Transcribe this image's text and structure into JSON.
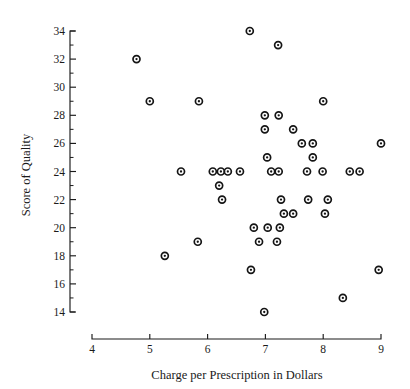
{
  "chart_data": {
    "type": "scatter",
    "title": "",
    "xlabel": "Charge per Prescription in Dollars",
    "ylabel": "Score of Quality",
    "xlim": [
      4,
      9
    ],
    "ylim": [
      14,
      34
    ],
    "x_ticks": [
      4,
      5,
      6,
      7,
      8,
      9
    ],
    "x_tick_labels": [
      "4",
      "5",
      "6",
      "7",
      "8",
      "9"
    ],
    "y_ticks": [
      14,
      16,
      18,
      20,
      22,
      24,
      26,
      28,
      30,
      32,
      34
    ],
    "y_tick_labels": [
      "14",
      "16",
      "18",
      "20",
      "22",
      "24",
      "26",
      "28",
      "30",
      "32",
      "34"
    ],
    "y_minor_tick_step": 1,
    "grid": false,
    "legend": null,
    "marker": "circle-with-center-dot",
    "marker_color": "#151515",
    "points": [
      {
        "x": 6.73,
        "y": 34
      },
      {
        "x": 7.22,
        "y": 33
      },
      {
        "x": 4.77,
        "y": 32
      },
      {
        "x": 5.0,
        "y": 29
      },
      {
        "x": 5.85,
        "y": 29
      },
      {
        "x": 8.0,
        "y": 29
      },
      {
        "x": 6.99,
        "y": 28
      },
      {
        "x": 7.23,
        "y": 28
      },
      {
        "x": 6.99,
        "y": 27
      },
      {
        "x": 7.48,
        "y": 27
      },
      {
        "x": 7.63,
        "y": 26
      },
      {
        "x": 7.82,
        "y": 26
      },
      {
        "x": 9.0,
        "y": 26
      },
      {
        "x": 7.03,
        "y": 25
      },
      {
        "x": 7.82,
        "y": 25
      },
      {
        "x": 5.54,
        "y": 24
      },
      {
        "x": 6.09,
        "y": 24
      },
      {
        "x": 6.23,
        "y": 24
      },
      {
        "x": 6.35,
        "y": 24
      },
      {
        "x": 6.56,
        "y": 24
      },
      {
        "x": 7.1,
        "y": 24
      },
      {
        "x": 7.23,
        "y": 24
      },
      {
        "x": 7.72,
        "y": 24
      },
      {
        "x": 7.99,
        "y": 24
      },
      {
        "x": 8.46,
        "y": 24
      },
      {
        "x": 8.63,
        "y": 24
      },
      {
        "x": 6.2,
        "y": 23
      },
      {
        "x": 6.25,
        "y": 22
      },
      {
        "x": 7.27,
        "y": 22
      },
      {
        "x": 7.74,
        "y": 22
      },
      {
        "x": 8.08,
        "y": 22
      },
      {
        "x": 7.32,
        "y": 21
      },
      {
        "x": 7.48,
        "y": 21
      },
      {
        "x": 8.03,
        "y": 21
      },
      {
        "x": 6.8,
        "y": 20
      },
      {
        "x": 7.04,
        "y": 20
      },
      {
        "x": 7.25,
        "y": 20
      },
      {
        "x": 5.83,
        "y": 19
      },
      {
        "x": 6.89,
        "y": 19
      },
      {
        "x": 7.2,
        "y": 19
      },
      {
        "x": 5.26,
        "y": 18
      },
      {
        "x": 6.75,
        "y": 17
      },
      {
        "x": 8.96,
        "y": 17
      },
      {
        "x": 8.34,
        "y": 15
      },
      {
        "x": 6.98,
        "y": 14
      }
    ]
  },
  "colors": {
    "ink": "#1a1a1a",
    "marker": "#151515",
    "background": "#ffffff"
  }
}
